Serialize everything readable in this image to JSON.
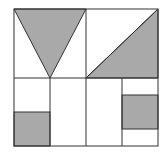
{
  "diagram": {
    "colors": {
      "fill": "#a9a9a9",
      "stroke": "#333333",
      "background": "#ffffff"
    },
    "outer_square": {
      "x": 14,
      "y": 9,
      "w": 144,
      "h": 137
    },
    "shaded_shapes": [
      {
        "name": "inverted-triangle",
        "points": "14,9 86,9 50,78"
      },
      {
        "name": "right-triangle",
        "points": "158,9 158,78 86,78"
      },
      {
        "name": "bottom-left-square",
        "x": 14,
        "y": 112,
        "w": 36,
        "h": 34
      },
      {
        "name": "right-rectangle",
        "x": 122,
        "y": 95,
        "w": 36,
        "h": 34
      }
    ]
  }
}
